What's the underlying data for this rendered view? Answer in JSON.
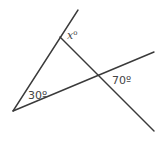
{
  "diagram": {
    "type": "geometry-angles",
    "stroke_color": "#3a3a3a",
    "label_color": "#444444",
    "background": "#ffffff",
    "points": {
      "vertex": [
        13,
        111
      ],
      "top_left_end": [
        78,
        10
      ],
      "right_end": [
        154,
        52
      ],
      "cross_start": [
        60,
        37
      ],
      "cross_end": [
        154,
        131
      ],
      "intersection": [
        98,
        77
      ]
    },
    "labels": {
      "x_var": "x",
      "x_deg": "o",
      "angle_30": "30º",
      "angle_70": "70º"
    },
    "label_positions": {
      "x": [
        67,
        39
      ],
      "angle_30": [
        28,
        99
      ],
      "angle_70": [
        112,
        84
      ]
    }
  }
}
